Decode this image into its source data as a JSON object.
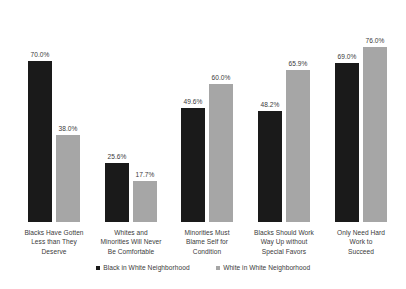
{
  "chart_data": {
    "type": "bar",
    "title": "",
    "subtitle": "",
    "xlabel": "",
    "ylabel": "",
    "ylim": [
      0,
      80
    ],
    "grid": false,
    "legend_position": "bottom",
    "value_suffix": "%",
    "categories": [
      "Blacks Have Gotten Less than They Deserve",
      "Whites and Minorities Will Never Be Comfortable",
      "Minorities Must Blame Self for Condition",
      "Blacks Should Work Way Up without Special Favors",
      "Only Need Hard Work to Succeed"
    ],
    "category_lines": [
      [
        "Blacks Have Gotten",
        "Less than They",
        "Deserve"
      ],
      [
        "Whites and",
        "Minorities Will Never",
        "Be Comfortable"
      ],
      [
        "Minorities Must",
        "Blame Self for",
        "Condition"
      ],
      [
        "Blacks Should Work",
        "Way Up without",
        "Special Favors"
      ],
      [
        "Only Need Hard",
        "Work to",
        "Succeed"
      ]
    ],
    "series": [
      {
        "name": "Black in White Neighborhood",
        "color": "#1a1a1a",
        "values": [
          70.0,
          25.6,
          49.6,
          48.2,
          69.0
        ],
        "labels": [
          "70.0%",
          "25.6%",
          "49.6%",
          "48.2%",
          "69.0%"
        ]
      },
      {
        "name": "White in White Neighborhood",
        "color": "#a6a6a6",
        "values": [
          38.0,
          17.7,
          60.0,
          65.9,
          76.0
        ],
        "labels": [
          "38.0%",
          "17.7%",
          "60.0%",
          "65.9%",
          "76.0%"
        ]
      }
    ]
  }
}
